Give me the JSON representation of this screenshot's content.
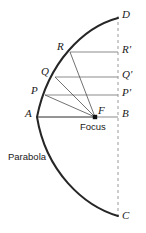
{
  "figure": {
    "curve_label": "Parabola",
    "focus_label": "Focus",
    "colors": {
      "curve": "#262626",
      "ray": "#4d4d4d",
      "chord": "#8c8c8c",
      "axis_dashed": "#9a9a9a",
      "text": "#1a1a1a",
      "background": "#ffffff"
    },
    "points": [
      {
        "id": "D",
        "label": "D",
        "x": 118,
        "y": 18,
        "label_x": 122,
        "label_y": 9,
        "style": "italic-serif"
      },
      {
        "id": "R",
        "label": "R",
        "x": 70,
        "y": 52,
        "label_x": 57,
        "label_y": 41,
        "style": "italic-serif"
      },
      {
        "id": "Rp",
        "label": "R'",
        "x": 118,
        "y": 52,
        "label_x": 122,
        "label_y": 44,
        "style": "italic-serif"
      },
      {
        "id": "Q",
        "label": "Q",
        "x": 55,
        "y": 77,
        "label_x": 41,
        "label_y": 66,
        "style": "italic-serif"
      },
      {
        "id": "Qp",
        "label": "Q'",
        "x": 118,
        "y": 77,
        "label_x": 122,
        "label_y": 69,
        "style": "italic-serif"
      },
      {
        "id": "P",
        "label": "P",
        "x": 45,
        "y": 95,
        "label_x": 31,
        "label_y": 85,
        "style": "italic-serif"
      },
      {
        "id": "Pp",
        "label": "P'",
        "x": 118,
        "y": 95,
        "label_x": 122,
        "label_y": 87,
        "style": "italic-serif"
      },
      {
        "id": "A",
        "label": "A",
        "x": 37,
        "y": 117,
        "label_x": 25,
        "label_y": 108,
        "style": "italic-serif"
      },
      {
        "id": "F",
        "label": "F",
        "x": 95,
        "y": 117,
        "label_x": 98,
        "label_y": 105,
        "style": "italic-serif"
      },
      {
        "id": "B",
        "label": "B",
        "x": 118,
        "y": 117,
        "label_x": 122,
        "label_y": 108,
        "style": "italic-serif"
      },
      {
        "id": "C",
        "label": "C",
        "x": 118,
        "y": 216,
        "label_x": 122,
        "label_y": 210,
        "style": "italic-serif"
      }
    ],
    "annotations": [
      {
        "id": "focus-text",
        "text": "Focus",
        "x": 80,
        "y": 122,
        "font": "sans"
      },
      {
        "id": "parabola-text",
        "text": "Parabola",
        "x": 8,
        "y": 152,
        "font": "sans"
      }
    ],
    "geometry": {
      "vertex": {
        "x": 37,
        "y": 117
      },
      "focus": {
        "x": 95,
        "y": 117
      },
      "directrix_x": 118,
      "curve_top_end": {
        "x": 118,
        "y": 18
      },
      "curve_bottom_end": {
        "x": 118,
        "y": 216
      },
      "chords": [
        {
          "from": "R",
          "to": "Rp",
          "y": 52
        },
        {
          "from": "Q",
          "to": "Qp",
          "y": 77
        },
        {
          "from": "P",
          "to": "Pp",
          "y": 95
        },
        {
          "from": "A",
          "to": "B",
          "y": 117
        }
      ],
      "focal_rays": [
        {
          "from": "F",
          "to": "R"
        },
        {
          "from": "F",
          "to": "Q"
        },
        {
          "from": "F",
          "to": "P"
        },
        {
          "from": "F",
          "to": "A"
        }
      ]
    }
  }
}
